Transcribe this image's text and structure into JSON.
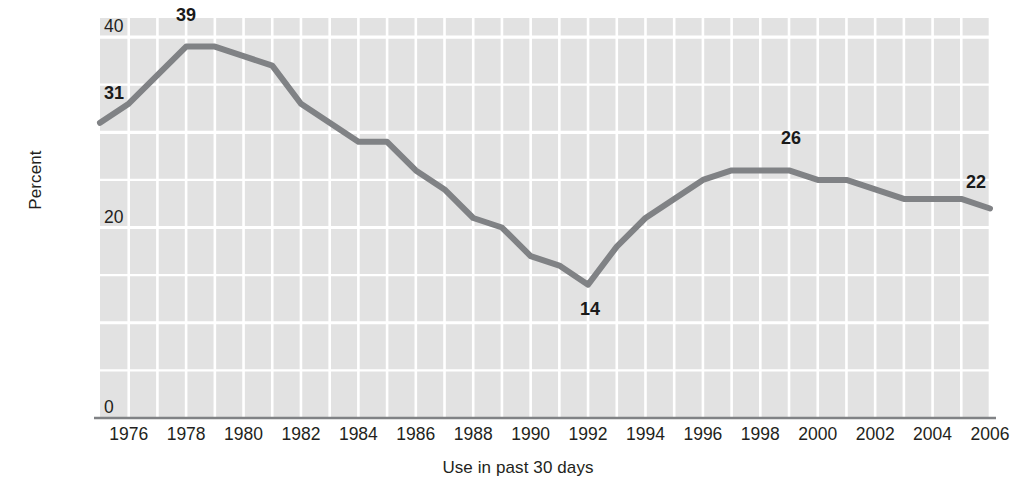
{
  "chart_data": {
    "type": "line",
    "title": "",
    "xlabel": "Use in past 30 days",
    "ylabel": "Percent",
    "xlim": [
      1975,
      2006
    ],
    "ylim": [
      0,
      42
    ],
    "y_ticks": [
      0,
      20,
      40
    ],
    "y_tick_labels": [
      "0",
      "20",
      "40"
    ],
    "y_gridlines": [
      5,
      10,
      15,
      20,
      25,
      30,
      35,
      40
    ],
    "x_ticks": [
      1976,
      1978,
      1980,
      1982,
      1984,
      1986,
      1988,
      1990,
      1992,
      1994,
      1996,
      1998,
      2000,
      2002,
      2004,
      2006
    ],
    "x_tick_labels": [
      "1976",
      "1978",
      "1980",
      "1982",
      "1984",
      "1986",
      "1988",
      "1990",
      "1992",
      "1994",
      "1996",
      "1998",
      "2000",
      "2002",
      "2004",
      "2006"
    ],
    "grid": true,
    "legend": "none",
    "line_color": "#808285",
    "plot_background": "#e2e2e2",
    "gridline_color": "#ffffff",
    "axis_color": "#808285",
    "x": [
      1975,
      1976,
      1977,
      1978,
      1979,
      1980,
      1981,
      1982,
      1983,
      1984,
      1985,
      1986,
      1987,
      1988,
      1989,
      1990,
      1991,
      1992,
      1993,
      1994,
      1995,
      1996,
      1997,
      1998,
      1999,
      2000,
      2001,
      2002,
      2003,
      2004,
      2005,
      2006
    ],
    "values": [
      31,
      33,
      36,
      39,
      39,
      38,
      37,
      33,
      31,
      29,
      29,
      26,
      24,
      21,
      20,
      17,
      16,
      14,
      18,
      21,
      23,
      25,
      26,
      26,
      26,
      25,
      25,
      24,
      23,
      23,
      23,
      22
    ],
    "annotations": [
      {
        "label": "31",
        "year": 1975,
        "value": 31
      },
      {
        "label": "39",
        "year": 1978,
        "value": 39
      },
      {
        "label": "14",
        "year": 1992,
        "value": 14
      },
      {
        "label": "26",
        "year": 1999,
        "value": 26
      },
      {
        "label": "22",
        "year": 2006,
        "value": 22
      }
    ]
  }
}
